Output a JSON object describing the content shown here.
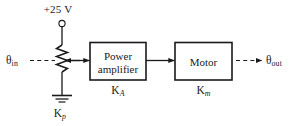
{
  "diagram": {
    "stroke_color": "#1a1a1a",
    "background_color": "#ffffff",
    "source_label": "+25 V",
    "input_label": {
      "symbol": "θ",
      "subscript": "in"
    },
    "output_label": {
      "symbol": "θ",
      "subscript": "out"
    },
    "potentiometer": {
      "name": "potentiometer",
      "gain_symbol": "K",
      "gain_subscript": "p",
      "terminal": "supply-terminal-node",
      "ground": "ground-symbol"
    },
    "blocks": [
      {
        "id": "power-amplifier",
        "line1": "Power",
        "line2": "amplifier",
        "gain_symbol": "K",
        "gain_subscript": "A"
      },
      {
        "id": "motor",
        "line1": "Motor",
        "line2": "",
        "gain_symbol": "K",
        "gain_subscript": "m"
      }
    ],
    "connections": [
      {
        "id": "theta-in-to-wiper",
        "style": "dashed",
        "meaning": "mechanical input to potentiometer shaft"
      },
      {
        "id": "wiper-to-amplifier",
        "style": "solid",
        "meaning": "electrical signal"
      },
      {
        "id": "amplifier-to-motor",
        "style": "solid",
        "meaning": "electrical signal"
      },
      {
        "id": "motor-to-theta-out",
        "style": "dashed",
        "meaning": "mechanical output shaft"
      }
    ]
  }
}
